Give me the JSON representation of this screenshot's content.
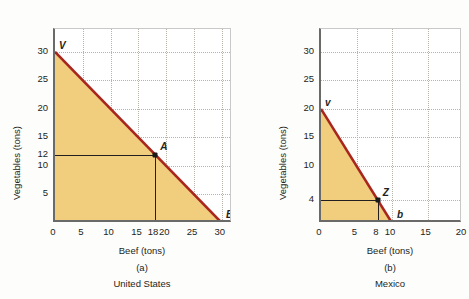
{
  "figure": {
    "background_color": "#fdfdfc",
    "frontier_color": "#a8261e",
    "region_fill_color": "#f0ce7e",
    "grid_color": "#b9b2a6",
    "axis_color": "#6a6a68"
  },
  "panels": [
    {
      "id": "panel-a",
      "caption_letter": "(a)",
      "caption_name": "United States",
      "xlabel": "Beef (tons)",
      "ylabel": "Vegetables (tons)",
      "xticks": [
        {
          "value": 0,
          "label": "0"
        },
        {
          "value": 5,
          "label": "5"
        },
        {
          "value": 10,
          "label": "10"
        },
        {
          "value": 15,
          "label": "15"
        },
        {
          "value": 18,
          "label": "18"
        },
        {
          "value": 20,
          "label": "20"
        },
        {
          "value": 25,
          "label": "25"
        },
        {
          "value": 30,
          "label": "30"
        }
      ],
      "yticks": [
        {
          "value": 5,
          "label": "5"
        },
        {
          "value": 10,
          "label": "10"
        },
        {
          "value": 12,
          "label": "12"
        },
        {
          "value": 15,
          "label": "15"
        },
        {
          "value": 20,
          "label": "20"
        },
        {
          "value": 25,
          "label": "25"
        },
        {
          "value": 30,
          "label": "30"
        }
      ],
      "xgrid": [
        5,
        10,
        15,
        20,
        25,
        30
      ],
      "ygrid": [
        5,
        10,
        15,
        20,
        25,
        30
      ],
      "labels": [
        {
          "text": "V",
          "x": 0,
          "y": 30,
          "dx": 4,
          "dy": -11
        },
        {
          "text": "A",
          "x": 18,
          "y": 12,
          "dx": 5,
          "dy": -13
        },
        {
          "text": "B",
          "x": 30,
          "y": 0,
          "dx": 4,
          "dy": -13
        }
      ],
      "points": [
        {
          "name": "A",
          "x": 18,
          "y": 12
        }
      ]
    },
    {
      "id": "panel-b",
      "caption_letter": "(b)",
      "caption_name": "Mexico",
      "xlabel": "Beef (tons)",
      "ylabel": "Vegetables (tons)",
      "xticks": [
        {
          "value": 0,
          "label": "0"
        },
        {
          "value": 5,
          "label": "5"
        },
        {
          "value": 8,
          "label": "8"
        },
        {
          "value": 10,
          "label": "10"
        },
        {
          "value": 15,
          "label": "15"
        },
        {
          "value": 20,
          "label": "20"
        }
      ],
      "yticks": [
        {
          "value": 4,
          "label": "4"
        },
        {
          "value": 10,
          "label": "10"
        },
        {
          "value": 15,
          "label": "15"
        },
        {
          "value": 20,
          "label": "20"
        },
        {
          "value": 25,
          "label": "25"
        },
        {
          "value": 30,
          "label": "30"
        }
      ],
      "xgrid": [
        5,
        10,
        15,
        20
      ],
      "ygrid": [
        4,
        10,
        15,
        20,
        25,
        30
      ],
      "labels": [
        {
          "text": "v",
          "x": 0,
          "y": 20,
          "dx": 4,
          "dy": -11
        },
        {
          "text": "Z",
          "x": 8,
          "y": 4,
          "dx": 5,
          "dy": -12
        },
        {
          "text": "b",
          "x": 10,
          "y": 0,
          "dx": 5,
          "dy": -13
        }
      ],
      "points": [
        {
          "name": "Z",
          "x": 8,
          "y": 4
        }
      ]
    }
  ],
  "chart_data": [
    {
      "type": "line",
      "title": "(a) United States",
      "subtitle": "United States production possibilities frontier",
      "xlabel": "Beef (tons)",
      "ylabel": "Vegetables (tons)",
      "xlim": [
        0,
        32
      ],
      "ylim": [
        0,
        34
      ],
      "grid": true,
      "legend": "none",
      "series": [
        {
          "name": "United States PPF",
          "color": "#a8261e",
          "x": [
            0,
            30
          ],
          "values": [
            30,
            0
          ]
        }
      ],
      "annotations": [
        {
          "label": "V",
          "x": 0,
          "y": 30,
          "note": "vertical intercept: all vegetables"
        },
        {
          "label": "A",
          "x": 18,
          "y": 12,
          "note": "production point on frontier"
        },
        {
          "label": "B",
          "x": 30,
          "y": 0,
          "note": "horizontal intercept: all beef"
        }
      ],
      "shaded_region": "area under frontier (feasible production set)",
      "xticks": [
        0,
        5,
        10,
        15,
        18,
        20,
        25,
        30
      ],
      "yticks": [
        0,
        5,
        10,
        12,
        15,
        20,
        25,
        30
      ]
    },
    {
      "type": "line",
      "title": "(b) Mexico",
      "subtitle": "Mexico production possibilities frontier",
      "xlabel": "Beef (tons)",
      "ylabel": "Vegetables (tons)",
      "xlim": [
        0,
        20
      ],
      "ylim": [
        0,
        34
      ],
      "grid": true,
      "legend": "none",
      "series": [
        {
          "name": "Mexico PPF",
          "color": "#a8261e",
          "x": [
            0,
            10
          ],
          "values": [
            20,
            0
          ]
        }
      ],
      "annotations": [
        {
          "label": "v",
          "x": 0,
          "y": 20,
          "note": "vertical intercept: all vegetables"
        },
        {
          "label": "Z",
          "x": 8,
          "y": 4,
          "note": "production point on frontier"
        },
        {
          "label": "b",
          "x": 10,
          "y": 0,
          "note": "horizontal intercept: all beef"
        }
      ],
      "shaded_region": "area under frontier (feasible production set)",
      "xticks": [
        0,
        5,
        8,
        10,
        15,
        20
      ],
      "yticks": [
        0,
        4,
        10,
        15,
        20,
        25,
        30
      ]
    }
  ]
}
